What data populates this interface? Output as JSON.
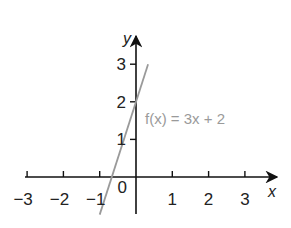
{
  "chart_data": {
    "type": "line",
    "title": "",
    "xlabel": "x",
    "ylabel": "y",
    "xlim": [
      -3,
      3
    ],
    "ylim": [
      -1,
      3
    ],
    "grid": false,
    "x_ticks": [
      -3,
      -2,
      -1,
      1,
      2,
      3
    ],
    "x_tick_labels": [
      "−3",
      "−2",
      "−1",
      "1",
      "2",
      "3"
    ],
    "y_ticks": [
      1,
      2,
      3
    ],
    "y_tick_labels": [
      "1",
      "2",
      "3"
    ],
    "origin_label": "0",
    "series": [
      {
        "name": "f(x) = 3x + 2",
        "equation": {
          "slope": 3,
          "intercept": 2
        },
        "x": [
          -1,
          0.333
        ],
        "y": [
          -1,
          3
        ],
        "color": "#9a9a9a"
      }
    ],
    "annotations": [
      {
        "text": "f(x) = 3x + 2",
        "near": "right of y-axis at y≈2"
      }
    ]
  }
}
